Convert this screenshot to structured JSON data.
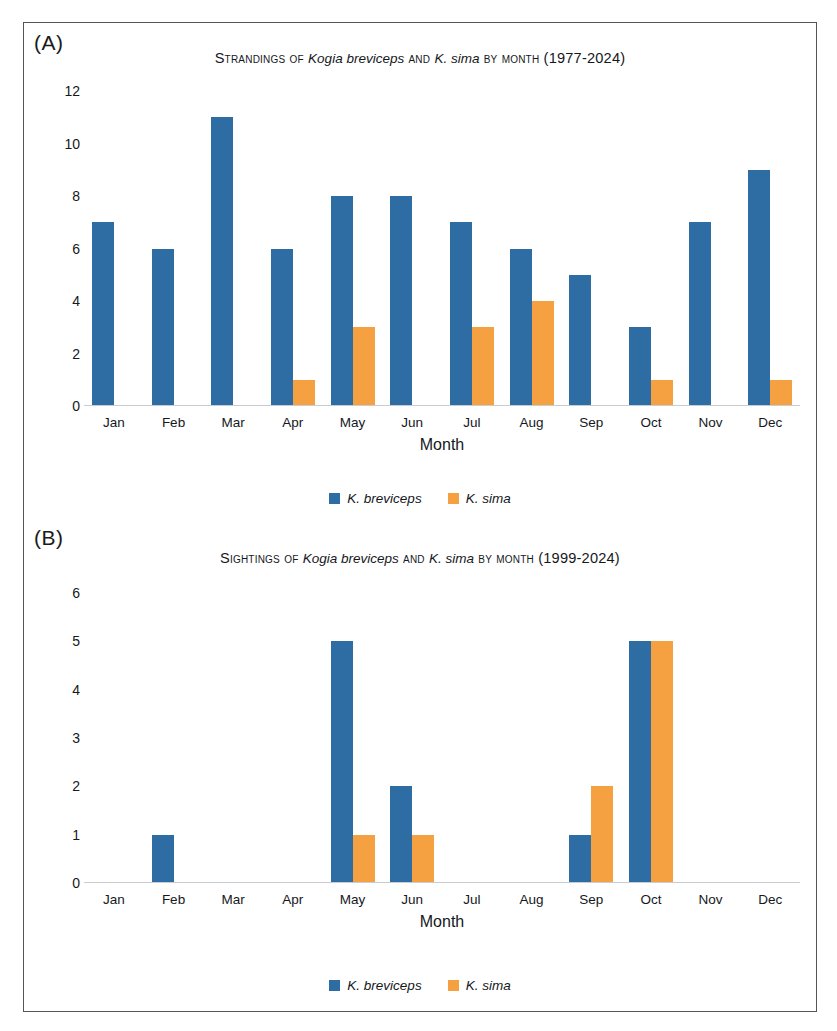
{
  "figure": {
    "series": [
      {
        "key": "breviceps",
        "label": "K. breviceps",
        "color": "#2E6DA4"
      },
      {
        "key": "sima",
        "label": "K. sima",
        "color": "#F5A142"
      }
    ],
    "panels": [
      {
        "letter": "(A)",
        "title_prefix": "Strandings of ",
        "title_taxon_1": "Kogia breviceps",
        "title_mid": " and ",
        "title_taxon_2": "K. sima",
        "title_suffix": " by month (1977-2024)",
        "xlabel": "Month",
        "yticks": [
          "12",
          "10",
          "8",
          "6",
          "4",
          "2",
          "0"
        ]
      },
      {
        "letter": "(B)",
        "title_prefix": "Sightings of ",
        "title_taxon_1": "Kogia breviceps",
        "title_mid": " and ",
        "title_taxon_2": "K. sima",
        "title_suffix": " by month (1999-2024)",
        "xlabel": "Month",
        "yticks": [
          "6",
          "5",
          "4",
          "3",
          "2",
          "1",
          "0"
        ]
      }
    ]
  },
  "chart_data": [
    {
      "type": "bar",
      "panel": "A",
      "title": "Strandings of Kogia breviceps and K. sima by month (1977-2024)",
      "xlabel": "Month",
      "ylabel": "",
      "ylim": [
        0,
        12
      ],
      "ytick_step": 2,
      "grid": false,
      "legend_position": "bottom-center",
      "categories": [
        "Jan",
        "Feb",
        "Mar",
        "Apr",
        "May",
        "Jun",
        "Jul",
        "Aug",
        "Sep",
        "Oct",
        "Nov",
        "Dec"
      ],
      "series": [
        {
          "name": "K. breviceps",
          "color": "#2E6DA4",
          "values": [
            7,
            6,
            11,
            6,
            8,
            8,
            7,
            6,
            5,
            3,
            7,
            9
          ]
        },
        {
          "name": "K. sima",
          "color": "#F5A142",
          "values": [
            0,
            0,
            0,
            1,
            3,
            0,
            3,
            4,
            0,
            1,
            0,
            1
          ]
        }
      ]
    },
    {
      "type": "bar",
      "panel": "B",
      "title": "Sightings of Kogia breviceps and K. sima by month (1999-2024)",
      "xlabel": "Month",
      "ylabel": "",
      "ylim": [
        0,
        6
      ],
      "ytick_step": 1,
      "grid": false,
      "legend_position": "bottom-center",
      "categories": [
        "Jan",
        "Feb",
        "Mar",
        "Apr",
        "May",
        "Jun",
        "Jul",
        "Aug",
        "Sep",
        "Oct",
        "Nov",
        "Dec"
      ],
      "series": [
        {
          "name": "K. breviceps",
          "color": "#2E6DA4",
          "values": [
            0,
            1,
            0,
            0,
            5,
            2,
            0,
            0,
            1,
            5,
            0,
            0
          ]
        },
        {
          "name": "K. sima",
          "color": "#F5A142",
          "values": [
            0,
            0,
            0,
            0,
            1,
            1,
            0,
            0,
            2,
            5,
            0,
            0
          ]
        }
      ]
    }
  ]
}
